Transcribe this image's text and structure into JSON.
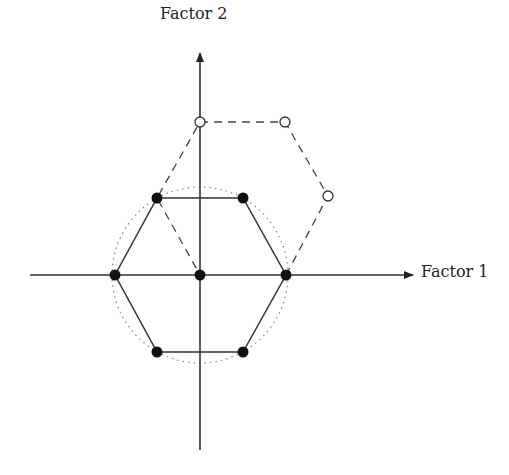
{
  "diagram": {
    "type": "design-of-experiments",
    "axes": {
      "x_label": "Factor 1",
      "y_label": "Factor 2",
      "origin": [
        200,
        275
      ]
    },
    "colors": {
      "line": "#333333",
      "filled_point": "#111111",
      "open_point_fill": "#ffffff",
      "circle": "#888888"
    },
    "filled_points": [
      {
        "x": 157,
        "y": 198
      },
      {
        "x": 243,
        "y": 198
      },
      {
        "x": 115,
        "y": 275
      },
      {
        "x": 200,
        "y": 275
      },
      {
        "x": 286,
        "y": 275
      },
      {
        "x": 157,
        "y": 352
      },
      {
        "x": 243,
        "y": 352
      }
    ],
    "open_points": [
      {
        "x": 200,
        "y": 122
      },
      {
        "x": 285,
        "y": 122
      },
      {
        "x": 328,
        "y": 196
      }
    ],
    "solid_hexagon": "hexagon of filled design points around center",
    "dashed_hexagon": "shifted hexagon through center, upper-left, open points and right point",
    "dotted_circle": {
      "cx": 200,
      "cy": 275,
      "r": 88
    }
  }
}
